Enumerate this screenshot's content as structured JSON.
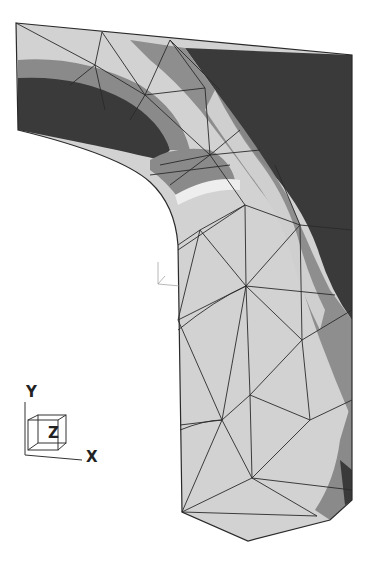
{
  "figure": {
    "type": "finite-element mesh contour plot",
    "colors": {
      "background": "#ffffff",
      "level_light": "#d2d2d2",
      "level_mid": "#8a8a8a",
      "level_dark": "#3a3a3a",
      "mesh_line": "#2a2a2a"
    }
  },
  "triad": {
    "y_label": "Y",
    "z_label": "Z",
    "x_label": "X"
  }
}
